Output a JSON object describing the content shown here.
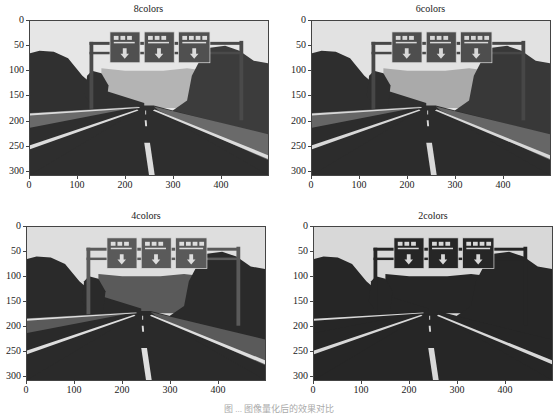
{
  "figure": {
    "caption": "图 ... 图像量化后的效果对比"
  },
  "chart_data": [
    {
      "type": "heatmap",
      "title": "8colors",
      "xlabel": "",
      "ylabel": "",
      "xticks": [
        0,
        100,
        200,
        300,
        400
      ],
      "yticks": [
        0,
        50,
        100,
        150,
        200,
        250,
        300
      ],
      "xlim": [
        0,
        500
      ],
      "ylim": [
        310,
        0
      ],
      "grid": false,
      "content": "road scene with overhead gantry signs, quantized to 8 gray levels"
    },
    {
      "type": "heatmap",
      "title": "6colors",
      "xlabel": "",
      "ylabel": "",
      "xticks": [
        0,
        100,
        200,
        300,
        400
      ],
      "yticks": [
        0,
        50,
        100,
        150,
        200,
        250,
        300
      ],
      "xlim": [
        0,
        500
      ],
      "ylim": [
        310,
        0
      ],
      "grid": false,
      "content": "road scene with overhead gantry signs, quantized to 6 gray levels"
    },
    {
      "type": "heatmap",
      "title": "4colors",
      "xlabel": "",
      "ylabel": "",
      "xticks": [
        0,
        100,
        200,
        300,
        400
      ],
      "yticks": [
        0,
        50,
        100,
        150,
        200,
        250,
        300
      ],
      "xlim": [
        0,
        500
      ],
      "ylim": [
        310,
        0
      ],
      "grid": false,
      "content": "road scene with overhead gantry signs, quantized to 4 gray levels"
    },
    {
      "type": "heatmap",
      "title": "2colors",
      "xlabel": "",
      "ylabel": "",
      "xticks": [
        0,
        100,
        200,
        300,
        400
      ],
      "yticks": [
        0,
        50,
        100,
        150,
        200,
        250,
        300
      ],
      "xlim": [
        0,
        500
      ],
      "ylim": [
        310,
        0
      ],
      "grid": false,
      "content": "road scene with overhead gantry signs, quantized to 2 gray levels"
    }
  ],
  "palettes": {
    "8colors": {
      "sky": "#e6e6e6",
      "hill": "#b4b4b4",
      "tree": "#303030",
      "tree2": "#3c3c3c",
      "road": "#2e2e2e",
      "shoulder": "#6a6a6a",
      "sign": "#505050",
      "mark": "#dcdcdc",
      "pole": "#4a4a4a"
    },
    "6colors": {
      "sky": "#e2e2e2",
      "hill": "#aaaaaa",
      "tree": "#2e2e2e",
      "tree2": "#383838",
      "road": "#2c2c2c",
      "shoulder": "#666666",
      "sign": "#4e4e4e",
      "mark": "#d8d8d8",
      "pole": "#474747"
    },
    "4colors": {
      "sky": "#dedede",
      "hill": "#5a5a5a",
      "tree": "#2a2a2a",
      "tree2": "#2a2a2a",
      "road": "#2a2a2a",
      "shoulder": "#5a5a5a",
      "sign": "#5a5a5a",
      "mark": "#dedede",
      "pole": "#5a5a5a"
    },
    "2colors": {
      "sky": "#d8d8d8",
      "hill": "#262626",
      "tree": "#262626",
      "tree2": "#262626",
      "road": "#262626",
      "shoulder": "#262626",
      "sign": "#262626",
      "mark": "#d8d8d8",
      "pole": "#262626"
    }
  }
}
